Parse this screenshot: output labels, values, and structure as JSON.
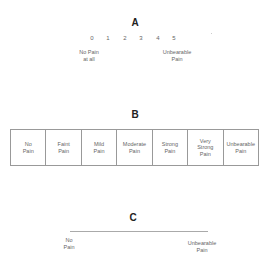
{
  "scale_a": {
    "title": "A",
    "ticks": [
      "0",
      "1",
      "2",
      "3",
      "4",
      "5"
    ],
    "left_label": "No Pain\nat all",
    "right_label": "Unbearable\nPain"
  },
  "scale_b": {
    "title": "B",
    "cells": [
      "No\nPain",
      "Faint\nPain",
      "Mild\nPain",
      "Moderate\nPain",
      "Strong\nPain",
      "Very\nStrong\nPain",
      "Unbearable\nPain"
    ]
  },
  "scale_c": {
    "title": "C",
    "left_label": "No\nPain",
    "right_label": "Unbearable\nPain"
  }
}
